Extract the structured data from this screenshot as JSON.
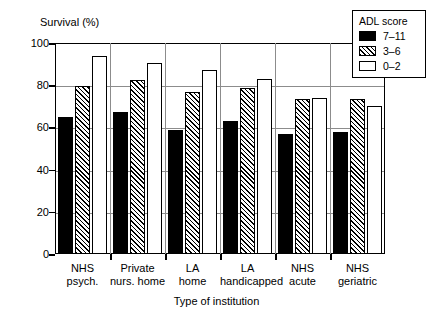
{
  "chart_data": {
    "type": "bar",
    "title": "",
    "ylabel": "Survival (%)",
    "xlabel": "Type of institution",
    "ylim": [
      0,
      100
    ],
    "yticks": [
      0,
      20,
      40,
      60,
      80,
      100
    ],
    "ytick_labels": [
      "0",
      "20",
      "40",
      "60",
      "80",
      "100"
    ],
    "grid": true,
    "legend_position": "top-right",
    "legend_title": "ADL score",
    "categories": [
      "NHS\npsych.",
      "Private\nnurs. home",
      "LA\nhome",
      "LA\nhandicapped",
      "NHS\nacute",
      "NHS\ngeriatric"
    ],
    "category_lines": [
      [
        "NHS",
        "psych."
      ],
      [
        "Private",
        "nurs. home"
      ],
      [
        "LA",
        "home"
      ],
      [
        "LA",
        "handicapped"
      ],
      [
        "NHS",
        "acute"
      ],
      [
        "NHS",
        "geriatric"
      ]
    ],
    "series": [
      {
        "name": "7–11",
        "fill": "solid-black",
        "color": "#000000",
        "values": [
          65,
          67.5,
          59,
          63,
          57,
          58
        ]
      },
      {
        "name": "3–6",
        "fill": "diagonal-hatch",
        "color": "#ffffff",
        "values": [
          79.5,
          82.5,
          77,
          78.5,
          73.5,
          73.5
        ]
      },
      {
        "name": "0–2",
        "fill": "white",
        "color": "#ffffff",
        "values": [
          94,
          90.5,
          87,
          83,
          74,
          70
        ]
      }
    ]
  },
  "axis": {
    "y_title": "Survival (%)",
    "x_title": "Type of institution"
  },
  "legend": {
    "title": "ADL score",
    "entries": [
      {
        "label": "7–11"
      },
      {
        "label": "3–6"
      },
      {
        "label": "0–2"
      }
    ]
  },
  "colors": {
    "axis": "#000000",
    "grid": "#8c8c8c",
    "series_high": "#000000",
    "series_mid": "#ffffff",
    "series_low": "#ffffff",
    "background": "#ffffff"
  }
}
